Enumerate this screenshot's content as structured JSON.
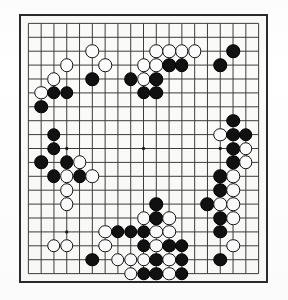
{
  "app": {
    "title": "Go Board Diagram",
    "board_type": "go-board",
    "size": 19,
    "colors": {
      "line": "#3a3a3a",
      "border": "#2b2b2b",
      "board_background": "#fbfbfa",
      "black_stone": "#111111",
      "white_stone": "#fcfcfc",
      "page_background": "#ffffff"
    },
    "star_points_label": "hoshi",
    "caption": ""
  },
  "board": {
    "columns": 19,
    "rows": 19,
    "star_points": [
      {
        "col": 4,
        "row": 4
      },
      {
        "col": 10,
        "row": 4
      },
      {
        "col": 16,
        "row": 4
      },
      {
        "col": 4,
        "row": 10
      },
      {
        "col": 10,
        "row": 10
      },
      {
        "col": 16,
        "row": 10
      },
      {
        "col": 4,
        "row": 16
      },
      {
        "col": 10,
        "row": 16
      },
      {
        "col": 16,
        "row": 16
      }
    ],
    "stones": [
      {
        "col": 6,
        "row": 3,
        "color": "white"
      },
      {
        "col": 11,
        "row": 3,
        "color": "white"
      },
      {
        "col": 12,
        "row": 3,
        "color": "white"
      },
      {
        "col": 13,
        "row": 3,
        "color": "white"
      },
      {
        "col": 14,
        "row": 3,
        "color": "white"
      },
      {
        "col": 17,
        "row": 3,
        "color": "black"
      },
      {
        "col": 4,
        "row": 4,
        "color": "white"
      },
      {
        "col": 7,
        "row": 4,
        "color": "white"
      },
      {
        "col": 10,
        "row": 4,
        "color": "white"
      },
      {
        "col": 11,
        "row": 4,
        "color": "white"
      },
      {
        "col": 12,
        "row": 4,
        "color": "black"
      },
      {
        "col": 13,
        "row": 4,
        "color": "black"
      },
      {
        "col": 16,
        "row": 4,
        "color": "black"
      },
      {
        "col": 3,
        "row": 5,
        "color": "white"
      },
      {
        "col": 6,
        "row": 5,
        "color": "black"
      },
      {
        "col": 9,
        "row": 5,
        "color": "black"
      },
      {
        "col": 10,
        "row": 5,
        "color": "white"
      },
      {
        "col": 11,
        "row": 5,
        "color": "black"
      },
      {
        "col": 2,
        "row": 6,
        "color": "white"
      },
      {
        "col": 3,
        "row": 6,
        "color": "black"
      },
      {
        "col": 4,
        "row": 6,
        "color": "black"
      },
      {
        "col": 10,
        "row": 6,
        "color": "black"
      },
      {
        "col": 11,
        "row": 6,
        "color": "black"
      },
      {
        "col": 2,
        "row": 7,
        "color": "black"
      },
      {
        "col": 17,
        "row": 8,
        "color": "black"
      },
      {
        "col": 16,
        "row": 9,
        "color": "white"
      },
      {
        "col": 17,
        "row": 9,
        "color": "black"
      },
      {
        "col": 18,
        "row": 9,
        "color": "black"
      },
      {
        "col": 3,
        "row": 9,
        "color": "black"
      },
      {
        "col": 3,
        "row": 10,
        "color": "black"
      },
      {
        "col": 17,
        "row": 10,
        "color": "black"
      },
      {
        "col": 18,
        "row": 10,
        "color": "white"
      },
      {
        "col": 17,
        "row": 11,
        "color": "black"
      },
      {
        "col": 18,
        "row": 11,
        "color": "white"
      },
      {
        "col": 2,
        "row": 11,
        "color": "black"
      },
      {
        "col": 4,
        "row": 11,
        "color": "black"
      },
      {
        "col": 5,
        "row": 11,
        "color": "white"
      },
      {
        "col": 3,
        "row": 12,
        "color": "black"
      },
      {
        "col": 4,
        "row": 12,
        "color": "white"
      },
      {
        "col": 5,
        "row": 12,
        "color": "black"
      },
      {
        "col": 6,
        "row": 12,
        "color": "white"
      },
      {
        "col": 16,
        "row": 12,
        "color": "black"
      },
      {
        "col": 17,
        "row": 12,
        "color": "white"
      },
      {
        "col": 4,
        "row": 13,
        "color": "white"
      },
      {
        "col": 16,
        "row": 13,
        "color": "black"
      },
      {
        "col": 17,
        "row": 13,
        "color": "white"
      },
      {
        "col": 4,
        "row": 14,
        "color": "white"
      },
      {
        "col": 11,
        "row": 14,
        "color": "black"
      },
      {
        "col": 15,
        "row": 14,
        "color": "black"
      },
      {
        "col": 16,
        "row": 14,
        "color": "white"
      },
      {
        "col": 17,
        "row": 14,
        "color": "white"
      },
      {
        "col": 10,
        "row": 15,
        "color": "white"
      },
      {
        "col": 11,
        "row": 15,
        "color": "black"
      },
      {
        "col": 12,
        "row": 15,
        "color": "white"
      },
      {
        "col": 16,
        "row": 15,
        "color": "black"
      },
      {
        "col": 17,
        "row": 15,
        "color": "white"
      },
      {
        "col": 7,
        "row": 16,
        "color": "white"
      },
      {
        "col": 8,
        "row": 16,
        "color": "black"
      },
      {
        "col": 9,
        "row": 16,
        "color": "black"
      },
      {
        "col": 10,
        "row": 16,
        "color": "black"
      },
      {
        "col": 11,
        "row": 16,
        "color": "white"
      },
      {
        "col": 12,
        "row": 16,
        "color": "white"
      },
      {
        "col": 16,
        "row": 16,
        "color": "black"
      },
      {
        "col": 3,
        "row": 17,
        "color": "white"
      },
      {
        "col": 4,
        "row": 17,
        "color": "white"
      },
      {
        "col": 7,
        "row": 17,
        "color": "white"
      },
      {
        "col": 10,
        "row": 17,
        "color": "black"
      },
      {
        "col": 11,
        "row": 17,
        "color": "white"
      },
      {
        "col": 12,
        "row": 17,
        "color": "black"
      },
      {
        "col": 13,
        "row": 17,
        "color": "black"
      },
      {
        "col": 17,
        "row": 17,
        "color": "white"
      },
      {
        "col": 6,
        "row": 18,
        "color": "black"
      },
      {
        "col": 8,
        "row": 18,
        "color": "white"
      },
      {
        "col": 9,
        "row": 18,
        "color": "white"
      },
      {
        "col": 10,
        "row": 18,
        "color": "white"
      },
      {
        "col": 11,
        "row": 18,
        "color": "black"
      },
      {
        "col": 12,
        "row": 18,
        "color": "white"
      },
      {
        "col": 13,
        "row": 18,
        "color": "black"
      },
      {
        "col": 16,
        "row": 18,
        "color": "black"
      },
      {
        "col": 9,
        "row": 19,
        "color": "white"
      },
      {
        "col": 10,
        "row": 19,
        "color": "black"
      },
      {
        "col": 11,
        "row": 19,
        "color": "black"
      },
      {
        "col": 12,
        "row": 19,
        "color": "white"
      },
      {
        "col": 13,
        "row": 19,
        "color": "black"
      }
    ]
  }
}
